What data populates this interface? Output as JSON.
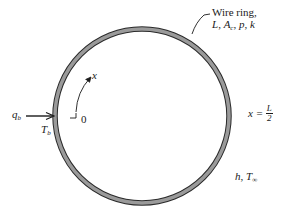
{
  "diagram": {
    "ring_label": {
      "line1": "Wire ring,",
      "vars": {
        "L": "L",
        "A": "A",
        "A_sub": "c",
        "p": "p",
        "k": "k"
      },
      "sep": ", "
    },
    "heat_input": {
      "symbol": "q",
      "sub": "b"
    },
    "base_temp": {
      "symbol": "T",
      "sub": "b"
    },
    "origin_label": "0",
    "coord_label": "x",
    "midpoint_label": {
      "prefix": "x = ",
      "num": "L",
      "den": "2"
    },
    "convection_label": {
      "h": "h",
      "sep": ", ",
      "T": "T",
      "T_sub": "∞"
    },
    "colors": {
      "ring_fill": "#9a9a9a",
      "ring_edge": "#2a2a2a",
      "text": "#1a1a1a",
      "background": "#ffffff"
    }
  }
}
